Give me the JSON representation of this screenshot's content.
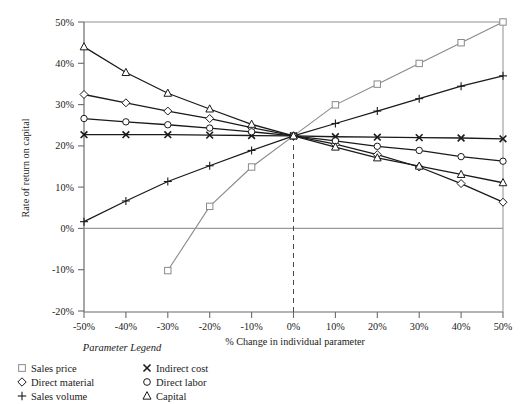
{
  "chart_data": {
    "type": "line",
    "title": "",
    "xlabel": "% Change in individual parameter",
    "ylabel": "Rate of return on capital",
    "xlim": [
      -50,
      50
    ],
    "ylim": [
      -20,
      50
    ],
    "x_ticks": [
      "-50%",
      "-40%",
      "-30%",
      "-20%",
      "-10%",
      "0%",
      "10%",
      "20%",
      "30%",
      "40%",
      "50%"
    ],
    "x_tick_values": [
      -50,
      -40,
      -30,
      -20,
      -10,
      0,
      10,
      20,
      30,
      40,
      50
    ],
    "y_ticks": [
      "50%",
      "40%",
      "30%",
      "20%",
      "10%",
      "0%",
      "-10%",
      "-20%"
    ],
    "y_tick_values": [
      50,
      40,
      30,
      20,
      10,
      0,
      -10,
      -20
    ],
    "grid": false,
    "zero_line_y": 0,
    "reference_line_x": 0,
    "reference_line_style": "dashed",
    "legend_position": "below-left",
    "legend_title": "Parameter Legend",
    "x": [
      -50,
      -40,
      -30,
      -20,
      -10,
      0,
      10,
      20,
      30,
      40,
      50
    ],
    "series": [
      {
        "name": "Sales price",
        "marker": "square",
        "color": "#8a8a8a",
        "x": [
          -30,
          -20,
          -10,
          0,
          10,
          20,
          30,
          40,
          50
        ],
        "values": [
          -10.0,
          5.5,
          15.0,
          22.5,
          30.0,
          35.0,
          40.0,
          45.0,
          50.0
        ]
      },
      {
        "name": "Direct material",
        "marker": "diamond",
        "color": "#1a1a1a",
        "x": [
          -50,
          -40,
          -30,
          -20,
          -10,
          0,
          10,
          20,
          30,
          40,
          50
        ],
        "values": [
          32.5,
          30.5,
          28.5,
          26.7,
          24.5,
          22.5,
          20.5,
          18.0,
          15.0,
          11.0,
          6.5
        ]
      },
      {
        "name": "Sales volume",
        "marker": "plus",
        "color": "#1a1a1a",
        "x": [
          -50,
          -40,
          -30,
          -20,
          -10,
          0,
          10,
          20,
          30,
          40,
          50
        ],
        "values": [
          1.8,
          6.8,
          11.5,
          15.3,
          19.0,
          22.5,
          25.5,
          28.5,
          31.5,
          34.5,
          37.0
        ]
      },
      {
        "name": "Indirect cost",
        "marker": "cross",
        "color": "#1a1a1a",
        "x": [
          -50,
          -40,
          -30,
          -20,
          -10,
          0,
          10,
          20,
          30,
          40,
          50
        ],
        "values": [
          22.8,
          22.8,
          22.8,
          22.7,
          22.6,
          22.5,
          22.3,
          22.2,
          22.1,
          22.0,
          21.8
        ]
      },
      {
        "name": "Direct labor",
        "marker": "circle",
        "color": "#1a1a1a",
        "x": [
          -50,
          -40,
          -30,
          -20,
          -10,
          0,
          10,
          20,
          30,
          40,
          50
        ],
        "values": [
          26.7,
          25.9,
          25.2,
          24.4,
          23.5,
          22.5,
          21.3,
          20.0,
          19.0,
          17.5,
          16.4
        ]
      },
      {
        "name": "Capital",
        "marker": "triangle",
        "color": "#1a1a1a",
        "x": [
          -50,
          -40,
          -30,
          -20,
          -10,
          0,
          10,
          20,
          30,
          40,
          50
        ],
        "values": [
          44.0,
          37.8,
          32.8,
          29.0,
          25.3,
          22.5,
          19.8,
          17.2,
          15.2,
          13.2,
          11.2
        ]
      }
    ]
  },
  "legend": {
    "title": "Parameter Legend",
    "entries": [
      {
        "label": "Sales price",
        "marker": "square"
      },
      {
        "label": "Indirect cost",
        "marker": "cross"
      },
      {
        "label": "Direct material",
        "marker": "diamond"
      },
      {
        "label": "Direct labor",
        "marker": "circle"
      },
      {
        "label": "Sales volume",
        "marker": "plus"
      },
      {
        "label": "Capital",
        "marker": "triangle"
      }
    ]
  },
  "colors": {
    "axis": "#808080",
    "line_dark": "#1a1a1a",
    "line_gray": "#8a8a8a",
    "background": "#ffffff"
  }
}
